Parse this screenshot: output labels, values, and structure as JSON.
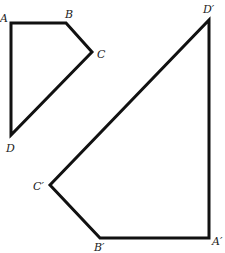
{
  "diagram": {
    "type": "geometric-transformation",
    "stroke_color": "#111111",
    "background": "#ffffff",
    "quadrilateral_original": {
      "name": "ABCD",
      "vertices": [
        {
          "label": "A",
          "x": 11,
          "y": 23,
          "lx": 0,
          "ly": 22
        },
        {
          "label": "B",
          "x": 66,
          "y": 23,
          "lx": 65,
          "ly": 18
        },
        {
          "label": "C",
          "x": 92,
          "y": 52,
          "lx": 97,
          "ly": 58
        },
        {
          "label": "D",
          "x": 11,
          "y": 135,
          "lx": 6,
          "ly": 152
        }
      ]
    },
    "quadrilateral_image": {
      "name": "A'B'C'D'",
      "vertices": [
        {
          "label": "A′",
          "x": 209,
          "y": 238,
          "lx": 212,
          "ly": 245
        },
        {
          "label": "B′",
          "x": 100,
          "y": 238,
          "lx": 94,
          "ly": 251
        },
        {
          "label": "C′",
          "x": 50,
          "y": 185,
          "lx": 33,
          "ly": 190
        },
        {
          "label": "D′",
          "x": 209,
          "y": 20,
          "lx": 203,
          "ly": 13
        }
      ]
    }
  }
}
